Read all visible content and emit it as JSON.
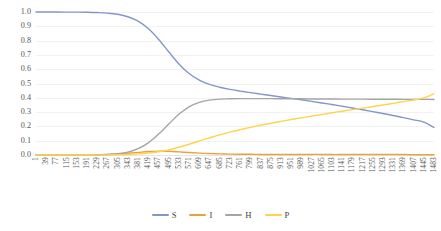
{
  "chart_data": {
    "type": "line",
    "title": "",
    "xlabel": "",
    "ylabel": "",
    "ylim": [
      0,
      1.0
    ],
    "xlim": [
      1,
      1483
    ],
    "grid": true,
    "legend_position": "bottom-center",
    "y_ticks": [
      "1.0",
      "0.9",
      "0.8",
      "0.7",
      "0.6",
      "0.5",
      "0.4",
      "0.3",
      "0.2",
      "0.1",
      "0.0"
    ],
    "y_tick_values": [
      1.0,
      0.9,
      0.8,
      0.7,
      0.6,
      0.5,
      0.4,
      0.3,
      0.2,
      0.1,
      0.0
    ],
    "x_tick_labels": [
      "1",
      "39",
      "77",
      "115",
      "153",
      "191",
      "229",
      "267",
      "305",
      "343",
      "381",
      "419",
      "457",
      "495",
      "533",
      "571",
      "609",
      "647",
      "685",
      "723",
      "761",
      "799",
      "837",
      "875",
      "913",
      "951",
      "989",
      "1027",
      "1065",
      "1103",
      "1141",
      "1179",
      "1217",
      "1255",
      "1293",
      "1331",
      "1369",
      "1407",
      "1445",
      "1483"
    ],
    "x": [
      1,
      39,
      77,
      115,
      153,
      191,
      229,
      267,
      305,
      343,
      381,
      419,
      457,
      495,
      533,
      571,
      609,
      647,
      685,
      723,
      761,
      799,
      837,
      875,
      913,
      951,
      989,
      1027,
      1065,
      1103,
      1141,
      1179,
      1217,
      1255,
      1293,
      1331,
      1369,
      1407,
      1445,
      1483
    ],
    "series": [
      {
        "name": "S",
        "color": "#8497C8",
        "values": [
          1.0,
          1.0,
          1.0,
          0.999,
          0.999,
          0.998,
          0.996,
          0.992,
          0.984,
          0.967,
          0.936,
          0.884,
          0.81,
          0.722,
          0.637,
          0.57,
          0.524,
          0.494,
          0.474,
          0.459,
          0.447,
          0.436,
          0.426,
          0.416,
          0.406,
          0.396,
          0.386,
          0.375,
          0.364,
          0.353,
          0.341,
          0.329,
          0.316,
          0.303,
          0.29,
          0.276,
          0.261,
          0.246,
          0.23,
          0.193
        ]
      },
      {
        "name": "I",
        "color": "#E8A33D",
        "values": [
          0.0,
          0.0,
          0.0,
          0.0,
          0.001,
          0.001,
          0.002,
          0.004,
          0.007,
          0.012,
          0.018,
          0.024,
          0.027,
          0.026,
          0.022,
          0.017,
          0.013,
          0.01,
          0.008,
          0.006,
          0.005,
          0.005,
          0.004,
          0.004,
          0.004,
          0.004,
          0.004,
          0.004,
          0.004,
          0.003,
          0.003,
          0.003,
          0.003,
          0.003,
          0.003,
          0.003,
          0.003,
          0.002,
          0.002,
          0.002
        ]
      },
      {
        "name": "H",
        "color": "#A5A5A5",
        "values": [
          0.0,
          0.0,
          0.0,
          0.0,
          0.0,
          0.001,
          0.002,
          0.004,
          0.009,
          0.02,
          0.044,
          0.085,
          0.145,
          0.216,
          0.285,
          0.337,
          0.368,
          0.384,
          0.391,
          0.393,
          0.394,
          0.394,
          0.394,
          0.394,
          0.393,
          0.393,
          0.393,
          0.392,
          0.392,
          0.392,
          0.391,
          0.391,
          0.391,
          0.39,
          0.39,
          0.39,
          0.389,
          0.389,
          0.389,
          0.388
        ]
      },
      {
        "name": "P",
        "color": "#FFD34E",
        "values": [
          0.0,
          0.0,
          0.0,
          0.0,
          0.0,
          0.0,
          0.001,
          0.001,
          0.002,
          0.004,
          0.008,
          0.014,
          0.023,
          0.036,
          0.054,
          0.075,
          0.098,
          0.12,
          0.141,
          0.16,
          0.177,
          0.193,
          0.208,
          0.222,
          0.235,
          0.248,
          0.26,
          0.272,
          0.283,
          0.295,
          0.306,
          0.317,
          0.328,
          0.339,
          0.35,
          0.361,
          0.373,
          0.385,
          0.399,
          0.428
        ]
      }
    ]
  },
  "legend": {
    "items": [
      {
        "label": "S",
        "color": "#8497C8"
      },
      {
        "label": "I",
        "color": "#E8A33D"
      },
      {
        "label": "H",
        "color": "#A5A5A5"
      },
      {
        "label": "P",
        "color": "#FFD34E"
      }
    ]
  }
}
